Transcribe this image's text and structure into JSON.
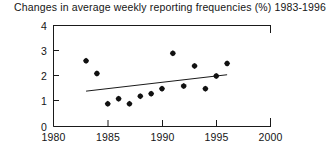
{
  "chart_data": {
    "type": "scatter",
    "title": "Changes in average weekly reporting frequencies (%) 1983-1996",
    "xlabel": "",
    "ylabel": "",
    "xlim": [
      1980,
      2000
    ],
    "ylim": [
      0,
      4
    ],
    "xticks": [
      1980,
      1985,
      1990,
      1995,
      2000
    ],
    "xtick_labels": [
      "1980",
      "1985",
      "1990",
      "1995",
      "2000"
    ],
    "yticks": [
      0,
      1,
      2,
      3,
      4
    ],
    "ytick_labels": [
      "0",
      "1",
      "2",
      "3",
      "4"
    ],
    "grid": false,
    "legend": null,
    "marker": "filled-diamond-dot",
    "series": [
      {
        "name": "Change in average weekly reporting frequency",
        "x": [
          1983,
          1984,
          1985,
          1986,
          1987,
          1988,
          1989,
          1990,
          1991,
          1992,
          1993,
          1994,
          1995,
          1996
        ],
        "values": [
          2.6,
          2.1,
          0.9,
          1.1,
          0.9,
          1.2,
          1.3,
          1.5,
          2.9,
          1.6,
          2.4,
          1.5,
          2.0,
          2.5
        ]
      }
    ],
    "trendline": {
      "type": "linear-fit",
      "x_start": 1983,
      "x_end": 1996,
      "y_start": 1.4,
      "y_end": 2.05
    }
  },
  "axes": {
    "y_tick_0": "0",
    "y_tick_1": "1",
    "y_tick_2": "2",
    "y_tick_3": "3",
    "y_tick_4": "4",
    "x_tick_0": "1980",
    "x_tick_1": "1985",
    "x_tick_2": "1990",
    "x_tick_3": "1995",
    "x_tick_4": "2000"
  }
}
